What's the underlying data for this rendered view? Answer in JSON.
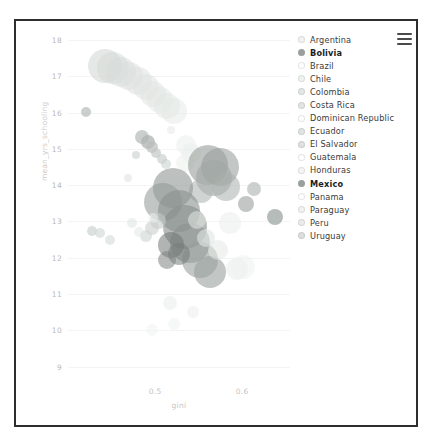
{
  "topstrip_text": "",
  "menu": {
    "icon": "hamburger-menu-icon",
    "label": "Chart menu"
  },
  "legend": {
    "items": [
      {
        "label": "Argentina",
        "color": "#f2f2f2",
        "highlighted": false
      },
      {
        "label": "Bolivia",
        "color": "#9aa0a0",
        "highlighted": true
      },
      {
        "label": "Brazil",
        "color": "#ffffff",
        "highlighted": false
      },
      {
        "label": "Chile",
        "color": "#eef3ee",
        "highlighted": false
      },
      {
        "label": "Colombia",
        "color": "#e2e6e4",
        "highlighted": false
      },
      {
        "label": "Costa Rica",
        "color": "#e0e4e2",
        "highlighted": false
      },
      {
        "label": "Dominican Republic",
        "color": "#ffffff",
        "highlighted": false
      },
      {
        "label": "Ecuador",
        "color": "#dfe3e1",
        "highlighted": false
      },
      {
        "label": "El Salvador",
        "color": "#dde1df",
        "highlighted": false
      },
      {
        "label": "Guatemala",
        "color": "#ffffff",
        "highlighted": false
      },
      {
        "label": "Honduras",
        "color": "#f3f6f3",
        "highlighted": false
      },
      {
        "label": "Mexico",
        "color": "#9aa0a0",
        "highlighted": true
      },
      {
        "label": "Panama",
        "color": "#ffffff",
        "highlighted": false
      },
      {
        "label": "Paraguay",
        "color": "#f0f3f0",
        "highlighted": false
      },
      {
        "label": "Peru",
        "color": "#e9ece9",
        "highlighted": false
      },
      {
        "label": "Uruguay",
        "color": "#dcdfdd",
        "highlighted": false
      }
    ]
  },
  "chart_data": {
    "type": "scatter",
    "title": "",
    "xlabel": "gini",
    "ylabel": "mean_yrs_schooling",
    "xlim": [
      0.4,
      0.655
    ],
    "ylim": [
      8.6,
      18.25
    ],
    "xticks": [
      0.5,
      0.6
    ],
    "xtick_labels": [
      "0.5",
      "0.6"
    ],
    "yticks": [
      9,
      10,
      11,
      12,
      13,
      14,
      15,
      16,
      17,
      18
    ],
    "ytick_labels": [
      "9",
      "10",
      "11",
      "12",
      "13",
      "14",
      "15",
      "16",
      "17",
      "18"
    ],
    "grid": true,
    "legend_position": "right",
    "size_encoding": "bubble radius = population",
    "points": [
      {
        "country": "Argentina",
        "x": 0.443,
        "y": 17.3,
        "r": 17,
        "color": "#cfd6d2",
        "alpha": 0.55
      },
      {
        "country": "Argentina",
        "x": 0.452,
        "y": 17.22,
        "r": 16,
        "color": "#d3d9d6",
        "alpha": 0.5
      },
      {
        "country": "Argentina",
        "x": 0.461,
        "y": 17.12,
        "r": 15,
        "color": "#d6dcd9",
        "alpha": 0.5
      },
      {
        "country": "Argentina",
        "x": 0.47,
        "y": 17.0,
        "r": 14,
        "color": "#d9dedb",
        "alpha": 0.5
      },
      {
        "country": "Argentina",
        "x": 0.48,
        "y": 16.86,
        "r": 14,
        "color": "#dbe0dd",
        "alpha": 0.5
      },
      {
        "country": "Argentina",
        "x": 0.489,
        "y": 16.7,
        "r": 13,
        "color": "#dde2df",
        "alpha": 0.5
      },
      {
        "country": "Argentina",
        "x": 0.498,
        "y": 16.52,
        "r": 13,
        "color": "#dfe4e1",
        "alpha": 0.5
      },
      {
        "country": "Argentina",
        "x": 0.506,
        "y": 16.35,
        "r": 13,
        "color": "#e0e5e2",
        "alpha": 0.5
      },
      {
        "country": "Argentina",
        "x": 0.514,
        "y": 16.18,
        "r": 13,
        "color": "#e2e7e4",
        "alpha": 0.5
      },
      {
        "country": "Argentina",
        "x": 0.522,
        "y": 16.05,
        "r": 13,
        "color": "#e4e9e6",
        "alpha": 0.5
      },
      {
        "country": "Uruguay",
        "x": 0.421,
        "y": 16.03,
        "r": 5,
        "color": "#b9bfbc",
        "alpha": 0.75
      },
      {
        "country": "Chile",
        "x": 0.485,
        "y": 15.32,
        "r": 7,
        "color": "#b4bab7",
        "alpha": 0.7
      },
      {
        "country": "Chile",
        "x": 0.492,
        "y": 15.18,
        "r": 7,
        "color": "#aeb4b1",
        "alpha": 0.75
      },
      {
        "country": "Chile",
        "x": 0.496,
        "y": 15.05,
        "r": 6,
        "color": "#b8bebb",
        "alpha": 0.7
      },
      {
        "country": "Chile",
        "x": 0.501,
        "y": 14.9,
        "r": 5,
        "color": "#c2c8c5",
        "alpha": 0.7
      },
      {
        "country": "Chile",
        "x": 0.478,
        "y": 14.82,
        "r": 4,
        "color": "#cdd3d0",
        "alpha": 0.65
      },
      {
        "country": "Chile",
        "x": 0.508,
        "y": 14.72,
        "r": 5,
        "color": "#c6ccc9",
        "alpha": 0.65
      },
      {
        "country": "Chile",
        "x": 0.512,
        "y": 14.58,
        "r": 5,
        "color": "#ccd2cf",
        "alpha": 0.6
      },
      {
        "country": "Panama",
        "x": 0.518,
        "y": 15.52,
        "r": 4,
        "color": "#e6ebe8",
        "alpha": 0.6
      },
      {
        "country": "Panama",
        "x": 0.536,
        "y": 15.1,
        "r": 10,
        "color": "#e9eeeb",
        "alpha": 0.55
      },
      {
        "country": "Panama",
        "x": 0.541,
        "y": 14.88,
        "r": 10,
        "color": "#eaefec",
        "alpha": 0.55
      },
      {
        "country": "Panama",
        "x": 0.534,
        "y": 14.6,
        "r": 9,
        "color": "#ecf0ed",
        "alpha": 0.55
      },
      {
        "country": "Costa Rica",
        "x": 0.469,
        "y": 14.2,
        "r": 4,
        "color": "#dde2df",
        "alpha": 0.6
      },
      {
        "country": "Mexico",
        "x": 0.561,
        "y": 14.55,
        "r": 20,
        "color": "#99a09d",
        "alpha": 0.62
      },
      {
        "country": "Mexico",
        "x": 0.575,
        "y": 14.5,
        "r": 19,
        "color": "#9ba29f",
        "alpha": 0.6
      },
      {
        "country": "Mexico",
        "x": 0.568,
        "y": 14.2,
        "r": 18,
        "color": "#a0a7a4",
        "alpha": 0.58
      },
      {
        "country": "Mexico",
        "x": 0.581,
        "y": 13.95,
        "r": 14,
        "color": "#a8afac",
        "alpha": 0.55
      },
      {
        "country": "Mexico",
        "x": 0.553,
        "y": 13.85,
        "r": 12,
        "color": "#aab1ae",
        "alpha": 0.55
      },
      {
        "country": "Colombia",
        "x": 0.614,
        "y": 13.9,
        "r": 7,
        "color": "#b6bcb9",
        "alpha": 0.7
      },
      {
        "country": "Colombia",
        "x": 0.604,
        "y": 13.48,
        "r": 8,
        "color": "#aab0ad",
        "alpha": 0.72
      },
      {
        "country": "Colombia",
        "x": 0.638,
        "y": 13.12,
        "r": 8,
        "color": "#9ea5a2",
        "alpha": 0.75
      },
      {
        "country": "Brazil",
        "x": 0.52,
        "y": 13.92,
        "r": 20,
        "color": "#8f9693",
        "alpha": 0.6
      },
      {
        "country": "Brazil",
        "x": 0.509,
        "y": 13.55,
        "r": 19,
        "color": "#949b98",
        "alpha": 0.58
      },
      {
        "country": "Brazil",
        "x": 0.527,
        "y": 13.28,
        "r": 21,
        "color": "#8a918e",
        "alpha": 0.6
      },
      {
        "country": "Brazil",
        "x": 0.534,
        "y": 12.85,
        "r": 22,
        "color": "#868d8a",
        "alpha": 0.6
      },
      {
        "country": "Brazil",
        "x": 0.54,
        "y": 12.4,
        "r": 20,
        "color": "#8b928f",
        "alpha": 0.58
      },
      {
        "country": "Brazil",
        "x": 0.551,
        "y": 11.95,
        "r": 18,
        "color": "#969d9a",
        "alpha": 0.58
      },
      {
        "country": "Brazil",
        "x": 0.563,
        "y": 11.62,
        "r": 16,
        "color": "#9aa1 9e",
        "alpha": 0.6
      },
      {
        "country": "Peru",
        "x": 0.503,
        "y": 13.0,
        "r": 8,
        "color": "#c3c9c6",
        "alpha": 0.6
      },
      {
        "country": "Peru",
        "x": 0.496,
        "y": 12.82,
        "r": 7,
        "color": "#c8cecb",
        "alpha": 0.6
      },
      {
        "country": "Peru",
        "x": 0.489,
        "y": 12.6,
        "r": 6,
        "color": "#cdd3d0",
        "alpha": 0.6
      },
      {
        "country": "Ecuador",
        "x": 0.548,
        "y": 13.05,
        "r": 9,
        "color": "#dde3e0",
        "alpha": 0.6
      },
      {
        "country": "Ecuador",
        "x": 0.558,
        "y": 12.55,
        "r": 9,
        "color": "#e0e6e3",
        "alpha": 0.6
      },
      {
        "country": "Ecuador",
        "x": 0.572,
        "y": 12.2,
        "r": 10,
        "color": "#e3e9e6",
        "alpha": 0.55
      },
      {
        "country": "El Salvador",
        "x": 0.594,
        "y": 11.7,
        "r": 11,
        "color": "#e7ecea",
        "alpha": 0.55
      },
      {
        "country": "Bolivia",
        "x": 0.518,
        "y": 12.35,
        "r": 13,
        "color": "#6f7673",
        "alpha": 0.55
      },
      {
        "country": "Bolivia",
        "x": 0.528,
        "y": 12.1,
        "r": 11,
        "color": "#757c79",
        "alpha": 0.55
      },
      {
        "country": "Bolivia",
        "x": 0.514,
        "y": 11.95,
        "r": 9,
        "color": "#7d8481",
        "alpha": 0.55
      },
      {
        "country": "Paraguay",
        "x": 0.427,
        "y": 12.75,
        "r": 5,
        "color": "#c9cfcc",
        "alpha": 0.65
      },
      {
        "country": "Paraguay",
        "x": 0.437,
        "y": 12.68,
        "r": 5,
        "color": "#cfd5d2",
        "alpha": 0.6
      },
      {
        "country": "Paraguay",
        "x": 0.448,
        "y": 12.48,
        "r": 5,
        "color": "#d4dad7",
        "alpha": 0.6
      },
      {
        "country": "Honduras",
        "x": 0.473,
        "y": 12.95,
        "r": 5,
        "color": "#dde3e0",
        "alpha": 0.55
      },
      {
        "country": "Honduras",
        "x": 0.481,
        "y": 12.72,
        "r": 5,
        "color": "#e1e7e4",
        "alpha": 0.55
      },
      {
        "country": "Guatemala",
        "x": 0.517,
        "y": 10.75,
        "r": 7,
        "color": "#e6ebe9",
        "alpha": 0.5
      },
      {
        "country": "Guatemala",
        "x": 0.544,
        "y": 10.5,
        "r": 6,
        "color": "#e9eeec",
        "alpha": 0.5
      },
      {
        "country": "Guatemala",
        "x": 0.522,
        "y": 10.18,
        "r": 6,
        "color": "#eef2f0",
        "alpha": 0.5
      },
      {
        "country": "Guatemala",
        "x": 0.496,
        "y": 10.02,
        "r": 6,
        "color": "#f0f4f2",
        "alpha": 0.5
      },
      {
        "country": "Dominican Republic",
        "x": 0.498,
        "y": 13.1,
        "r": 5,
        "color": "#ecf0ee",
        "alpha": 0.55
      },
      {
        "country": "Dominican Republic",
        "x": 0.586,
        "y": 12.95,
        "r": 11,
        "color": "#eaeeec",
        "alpha": 0.5
      },
      {
        "country": "Dominican Republic",
        "x": 0.601,
        "y": 11.75,
        "r": 12,
        "color": "#eef2f0",
        "alpha": 0.5
      }
    ]
  }
}
